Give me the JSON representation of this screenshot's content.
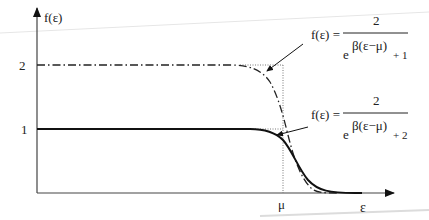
{
  "diagram": {
    "y_axis_label": "f(ε)",
    "x_axis_label": "ε",
    "y_ticks": [
      "2",
      "1"
    ],
    "x_ticks": [
      "μ"
    ],
    "formula_top": {
      "lhs": "f(ε) =",
      "numerator": "2",
      "exp_base": "e",
      "exponent": "β(ε−μ)",
      "denominator_tail": "+ 1"
    },
    "formula_bottom": {
      "lhs": "f(ε) =",
      "numerator": "2",
      "exp_base": "e",
      "exponent": "β(ε−μ)",
      "denominator_tail": "+ 2"
    },
    "curves": [
      {
        "name": "dashed",
        "style": "dashed",
        "plateau": 2,
        "formula": "2/(e^{β(ε−μ)}+1)"
      },
      {
        "name": "solid",
        "style": "solid",
        "plateau": 1,
        "formula": "2/(e^{β(ε−μ)}+2)"
      }
    ],
    "colors": {
      "ink": "#222222",
      "background": "#ffffff"
    }
  }
}
